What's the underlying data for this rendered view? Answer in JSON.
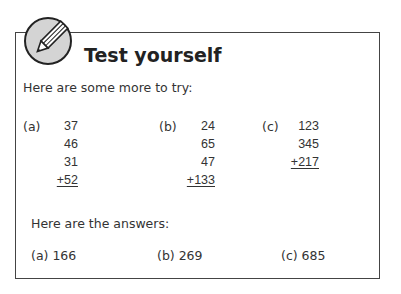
{
  "header": {
    "icon": "pencil-icon",
    "title": "Test yourself"
  },
  "intro": "Here are some more to try:",
  "problems": [
    {
      "label": "(a)",
      "addends": [
        "37",
        "46",
        "31"
      ],
      "last": "+52"
    },
    {
      "label": "(b)",
      "addends": [
        "24",
        "65",
        "47"
      ],
      "last": "+133"
    },
    {
      "label": "(c)",
      "addends": [
        "123",
        "345"
      ],
      "last": "+217"
    }
  ],
  "answers_heading": "Here are the answers:",
  "answers": [
    {
      "text": "(a) 166"
    },
    {
      "text": "(b) 269"
    },
    {
      "text": "(c) 685"
    }
  ]
}
